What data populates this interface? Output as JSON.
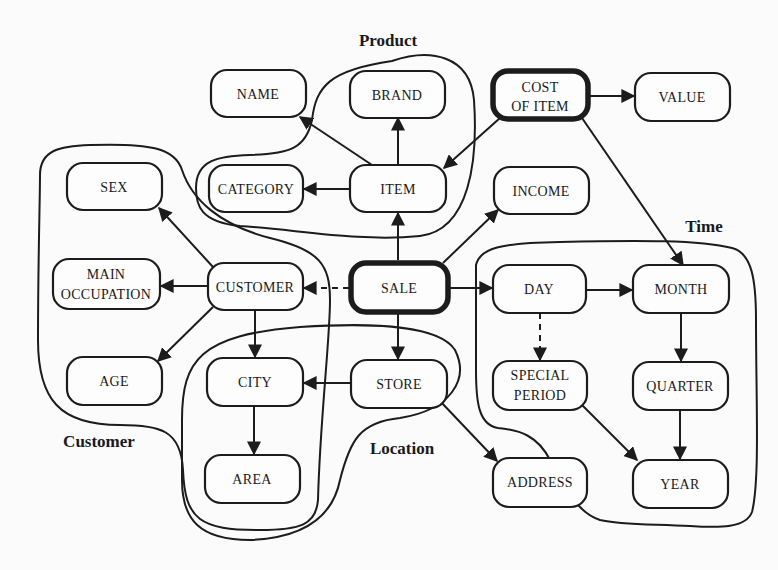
{
  "diagram": {
    "groups": [
      {
        "id": "product",
        "label": "Product"
      },
      {
        "id": "time",
        "label": "Time"
      },
      {
        "id": "customer",
        "label": "Customer"
      },
      {
        "id": "location",
        "label": "Location"
      }
    ],
    "nodes": [
      {
        "id": "name",
        "line1": "NAME",
        "line2": "",
        "emphasis": false
      },
      {
        "id": "brand",
        "line1": "BRAND",
        "line2": "",
        "emphasis": false
      },
      {
        "id": "cost_of_item",
        "line1": "COST",
        "line2": "OF ITEM",
        "emphasis": true
      },
      {
        "id": "value",
        "line1": "VALUE",
        "line2": "",
        "emphasis": false
      },
      {
        "id": "category",
        "line1": "CATEGORY",
        "line2": "",
        "emphasis": false
      },
      {
        "id": "item",
        "line1": "ITEM",
        "line2": "",
        "emphasis": false
      },
      {
        "id": "income",
        "line1": "INCOME",
        "line2": "",
        "emphasis": false
      },
      {
        "id": "sex",
        "line1": "SEX",
        "line2": "",
        "emphasis": false
      },
      {
        "id": "main_occupation",
        "line1": "MAIN",
        "line2": "OCCUPATION",
        "emphasis": false
      },
      {
        "id": "customer",
        "line1": "CUSTOMER",
        "line2": "",
        "emphasis": false
      },
      {
        "id": "sale",
        "line1": "SALE",
        "line2": "",
        "emphasis": true
      },
      {
        "id": "day",
        "line1": "DAY",
        "line2": "",
        "emphasis": false
      },
      {
        "id": "month",
        "line1": "MONTH",
        "line2": "",
        "emphasis": false
      },
      {
        "id": "age",
        "line1": "AGE",
        "line2": "",
        "emphasis": false
      },
      {
        "id": "city",
        "line1": "CITY",
        "line2": "",
        "emphasis": false
      },
      {
        "id": "store",
        "line1": "STORE",
        "line2": "",
        "emphasis": false
      },
      {
        "id": "special_period",
        "line1": "SPECIAL",
        "line2": "PERIOD",
        "emphasis": false
      },
      {
        "id": "quarter",
        "line1": "QUARTER",
        "line2": "",
        "emphasis": false
      },
      {
        "id": "area",
        "line1": "AREA",
        "line2": "",
        "emphasis": false
      },
      {
        "id": "address",
        "line1": "ADDRESS",
        "line2": "",
        "emphasis": false
      },
      {
        "id": "year",
        "line1": "YEAR",
        "line2": "",
        "emphasis": false
      }
    ],
    "edges": [
      {
        "from": "item",
        "to": "name",
        "style": "solid"
      },
      {
        "from": "item",
        "to": "brand",
        "style": "solid"
      },
      {
        "from": "item",
        "to": "category",
        "style": "solid"
      },
      {
        "from": "cost_of_item",
        "to": "item",
        "style": "solid"
      },
      {
        "from": "cost_of_item",
        "to": "value",
        "style": "solid"
      },
      {
        "from": "cost_of_item",
        "to": "month",
        "style": "solid"
      },
      {
        "from": "sale",
        "to": "item",
        "style": "solid"
      },
      {
        "from": "sale",
        "to": "income",
        "style": "solid"
      },
      {
        "from": "sale",
        "to": "customer",
        "style": "dashed"
      },
      {
        "from": "sale",
        "to": "day",
        "style": "solid"
      },
      {
        "from": "sale",
        "to": "store",
        "style": "solid"
      },
      {
        "from": "customer",
        "to": "sex",
        "style": "solid"
      },
      {
        "from": "customer",
        "to": "main_occupation",
        "style": "solid"
      },
      {
        "from": "customer",
        "to": "age",
        "style": "solid"
      },
      {
        "from": "customer",
        "to": "city",
        "style": "solid"
      },
      {
        "from": "store",
        "to": "city",
        "style": "solid"
      },
      {
        "from": "store",
        "to": "address",
        "style": "solid"
      },
      {
        "from": "city",
        "to": "area",
        "style": "solid"
      },
      {
        "from": "day",
        "to": "month",
        "style": "solid"
      },
      {
        "from": "day",
        "to": "special_period",
        "style": "dashed"
      },
      {
        "from": "month",
        "to": "quarter",
        "style": "solid"
      },
      {
        "from": "quarter",
        "to": "year",
        "style": "solid"
      },
      {
        "from": "special_period",
        "to": "year",
        "style": "solid"
      }
    ]
  }
}
